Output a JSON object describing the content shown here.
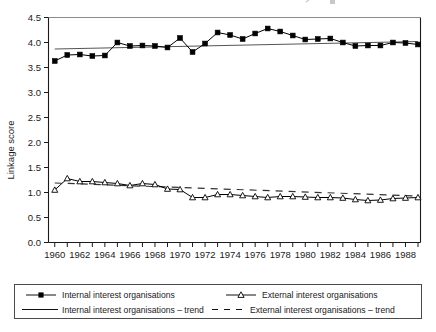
{
  "chart_data": {
    "type": "line",
    "title": "",
    "subtitle": "",
    "xlabel": "",
    "ylabel": "Linkage score",
    "xlim": [
      1959.5,
      1989.2
    ],
    "ylim": [
      0.0,
      4.5
    ],
    "yticks": [
      0.0,
      0.5,
      1.0,
      1.5,
      2.0,
      2.5,
      3.0,
      3.5,
      4.0,
      4.5
    ],
    "ytick_labels": [
      "0.0",
      "0.5",
      "1.0",
      "1.5",
      "2.0",
      "2.5",
      "3.0",
      "3.5",
      "4.0",
      "4.5"
    ],
    "x": [
      1960,
      1961,
      1962,
      1963,
      1964,
      1965,
      1966,
      1967,
      1968,
      1969,
      1970,
      1971,
      1972,
      1973,
      1974,
      1975,
      1976,
      1977,
      1978,
      1979,
      1980,
      1981,
      1982,
      1983,
      1984,
      1985,
      1986,
      1987,
      1988,
      1989
    ],
    "xticks": [
      1960,
      1961,
      1962,
      1963,
      1964,
      1965,
      1966,
      1967,
      1968,
      1969,
      1970,
      1971,
      1972,
      1973,
      1974,
      1975,
      1976,
      1977,
      1978,
      1979,
      1980,
      1981,
      1982,
      1983,
      1984,
      1985,
      1986,
      1987,
      1988,
      1989
    ],
    "xtick_labels": [
      {
        "x": 1960,
        "label": "1960"
      },
      {
        "x": 1962,
        "label": "1962"
      },
      {
        "x": 1964,
        "label": "1964"
      },
      {
        "x": 1966,
        "label": "1966"
      },
      {
        "x": 1968,
        "label": "1968"
      },
      {
        "x": 1970,
        "label": "1970"
      },
      {
        "x": 1972,
        "label": "1972"
      },
      {
        "x": 1974,
        "label": "1974"
      },
      {
        "x": 1976,
        "label": "1976"
      },
      {
        "x": 1978,
        "label": "1978"
      },
      {
        "x": 1980,
        "label": "1980"
      },
      {
        "x": 1982,
        "label": "1982"
      },
      {
        "x": 1984,
        "label": "1984"
      },
      {
        "x": 1986,
        "label": "1986"
      },
      {
        "x": 1988,
        "label": "1988"
      }
    ],
    "grid": false,
    "legend_position": "bottom",
    "series": [
      {
        "name": "Internal interest organisations",
        "key": "internal",
        "marker": "filled-square",
        "line_style": "solid",
        "color": "#000000",
        "values": [
          3.63,
          3.75,
          3.76,
          3.73,
          3.74,
          4.0,
          3.93,
          3.94,
          3.93,
          3.9,
          4.09,
          3.81,
          3.98,
          4.2,
          4.15,
          4.07,
          4.18,
          4.28,
          4.22,
          4.14,
          4.06,
          4.07,
          4.08,
          4.0,
          3.93,
          3.94,
          3.94,
          4.0,
          3.99,
          3.96
        ]
      },
      {
        "name": "External interest organisations",
        "key": "external",
        "marker": "open-triangle",
        "line_style": "solid",
        "color": "#000000",
        "values": [
          1.05,
          1.28,
          1.22,
          1.22,
          1.2,
          1.18,
          1.14,
          1.18,
          1.16,
          1.07,
          1.06,
          0.9,
          0.9,
          0.96,
          0.96,
          0.94,
          0.92,
          0.9,
          0.92,
          0.92,
          0.91,
          0.9,
          0.9,
          0.89,
          0.86,
          0.84,
          0.85,
          0.88,
          0.89,
          0.9
        ]
      }
    ],
    "trends": [
      {
        "name": "Internal interest organisations – trend",
        "key": "internal_trend",
        "line_style": "solid",
        "color": "#555555",
        "x_start": 1960,
        "x_end": 1989,
        "y_start": 3.87,
        "y_end": 4.02
      },
      {
        "name": "External interest organisations – trend",
        "key": "external_trend",
        "line_style": "dashed",
        "color": "#333333",
        "x_start": 1960,
        "x_end": 1989,
        "y_start": 1.19,
        "y_end": 0.93
      }
    ]
  },
  "legend": {
    "entries": [
      {
        "label": "Internal interest organisations",
        "marker": "filled-square",
        "style": "solid"
      },
      {
        "label": "External interest organisations",
        "marker": "open-triangle",
        "style": "solid"
      },
      {
        "label": "Internal interest organisations – trend",
        "marker": "none",
        "style": "solid"
      },
      {
        "label": "External interest organisations – trend",
        "marker": "none",
        "style": "dashed"
      }
    ]
  },
  "colors": {
    "axis": "#1a1a1a",
    "internal": "#000000",
    "external": "#000000",
    "internal_trend": "#555555",
    "external_trend": "#333333",
    "legend_border": "#4a4a4a",
    "background": "#ffffff"
  }
}
